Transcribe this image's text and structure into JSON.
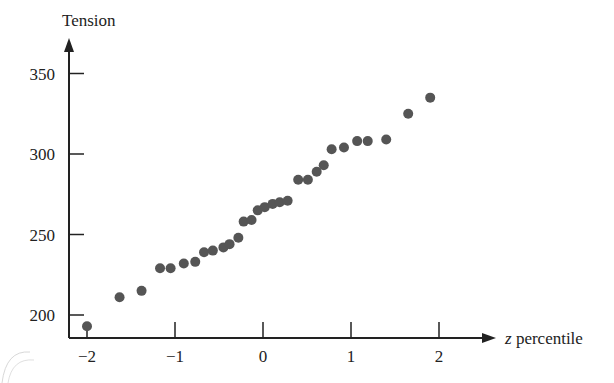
{
  "chart_data": {
    "type": "scatter",
    "title": "",
    "xlabel_italic": "z",
    "xlabel_rest": " percentile",
    "xlabel": "z percentile",
    "ylabel": "Tension",
    "x_ticks": [
      -2,
      -1,
      0,
      1,
      2
    ],
    "x_tick_labels": [
      "−2",
      "−1",
      "0",
      "1",
      "2"
    ],
    "y_ticks": [
      200,
      250,
      300,
      350
    ],
    "y_tick_labels": [
      "200",
      "250",
      "300",
      "350"
    ],
    "xlim": [
      -2.2,
      2.6
    ],
    "ylim": [
      186,
      375
    ],
    "grid": false,
    "legend": null,
    "marker_color": "#555555",
    "points": [
      {
        "x": -2.0,
        "y": 193
      },
      {
        "x": -1.63,
        "y": 211
      },
      {
        "x": -1.38,
        "y": 215
      },
      {
        "x": -1.17,
        "y": 229
      },
      {
        "x": -1.05,
        "y": 229
      },
      {
        "x": -0.9,
        "y": 232
      },
      {
        "x": -0.77,
        "y": 233
      },
      {
        "x": -0.67,
        "y": 239
      },
      {
        "x": -0.57,
        "y": 240
      },
      {
        "x": -0.45,
        "y": 242
      },
      {
        "x": -0.38,
        "y": 244
      },
      {
        "x": -0.28,
        "y": 248
      },
      {
        "x": -0.22,
        "y": 258
      },
      {
        "x": -0.13,
        "y": 259
      },
      {
        "x": -0.06,
        "y": 265
      },
      {
        "x": 0.02,
        "y": 267
      },
      {
        "x": 0.11,
        "y": 269
      },
      {
        "x": 0.19,
        "y": 270
      },
      {
        "x": 0.28,
        "y": 271
      },
      {
        "x": 0.4,
        "y": 284
      },
      {
        "x": 0.51,
        "y": 284
      },
      {
        "x": 0.61,
        "y": 289
      },
      {
        "x": 0.69,
        "y": 293
      },
      {
        "x": 0.78,
        "y": 303
      },
      {
        "x": 0.92,
        "y": 304
      },
      {
        "x": 1.07,
        "y": 308
      },
      {
        "x": 1.19,
        "y": 308
      },
      {
        "x": 1.4,
        "y": 309
      },
      {
        "x": 1.65,
        "y": 325
      },
      {
        "x": 1.9,
        "y": 335
      }
    ]
  }
}
